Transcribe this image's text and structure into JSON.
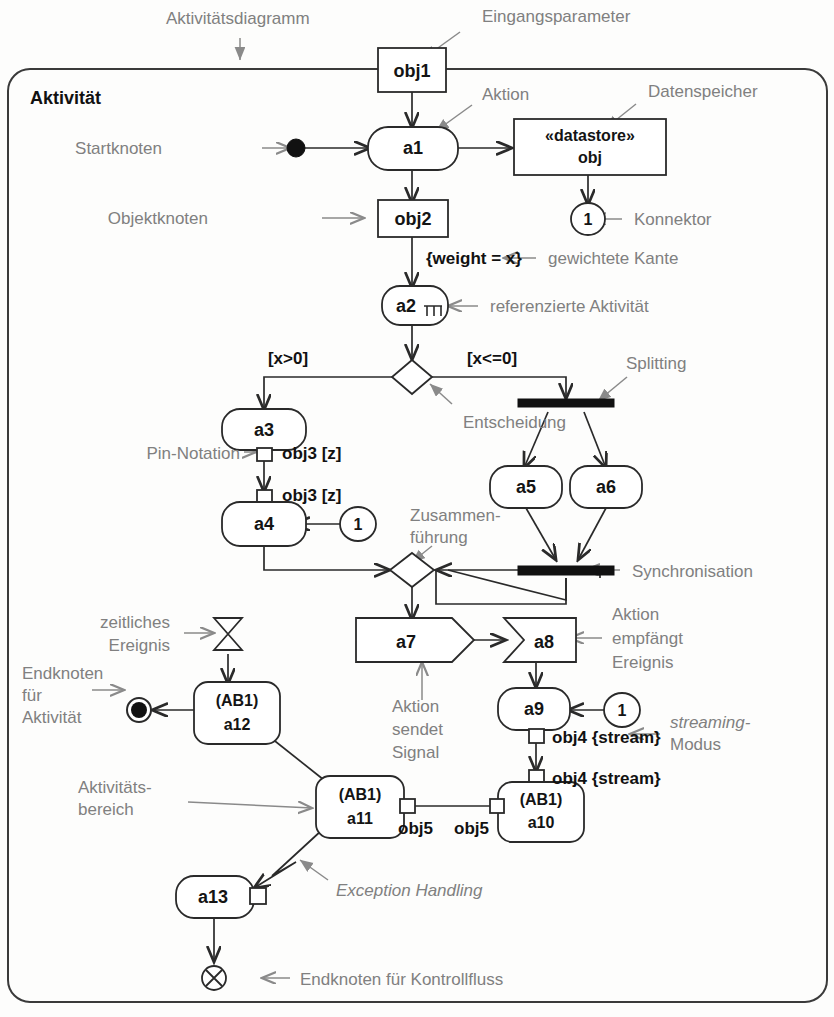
{
  "diagram": {
    "title": "Aktivitätsdiagramm",
    "frame_label": "Aktivität",
    "notation": "UML Aktivitätsdiagramm"
  },
  "annotations": [
    {
      "id": "aktivitaetsdiagramm",
      "text": "Aktivitätsdiagramm"
    },
    {
      "id": "eingangsparameter",
      "text": "Eingangsparameter"
    },
    {
      "id": "aktion",
      "text": "Aktion"
    },
    {
      "id": "datenspeicher",
      "text": "Datenspeicher"
    },
    {
      "id": "startknoten",
      "text": "Startknoten"
    },
    {
      "id": "objektknoten",
      "text": "Objektknoten"
    },
    {
      "id": "konnektor",
      "text": "Konnektor"
    },
    {
      "id": "gewichtete-kante",
      "text": "gewichtete Kante"
    },
    {
      "id": "referenzierte-aktivitaet",
      "text": "referenzierte Aktivität"
    },
    {
      "id": "entscheidung",
      "text": "Entscheidung"
    },
    {
      "id": "splitting",
      "text": "Splitting"
    },
    {
      "id": "pin-notation",
      "text": "Pin-Notation"
    },
    {
      "id": "zusammenfuehrung-1",
      "text": "Zusammen-"
    },
    {
      "id": "zusammenfuehrung-2",
      "text": "führung"
    },
    {
      "id": "synchronisation",
      "text": "Synchronisation"
    },
    {
      "id": "zeitliches-1",
      "text": "zeitliches"
    },
    {
      "id": "zeitliches-2",
      "text": "Ereignis"
    },
    {
      "id": "aktion-empfaengt-1",
      "text": "Aktion"
    },
    {
      "id": "aktion-empfaengt-2",
      "text": "empfängt"
    },
    {
      "id": "aktion-empfaengt-3",
      "text": "Ereignis"
    },
    {
      "id": "aktion-sendet-1",
      "text": "Aktion"
    },
    {
      "id": "aktion-sendet-2",
      "text": "sendet"
    },
    {
      "id": "aktion-sendet-3",
      "text": "Signal"
    },
    {
      "id": "endknoten-akt-1",
      "text": "Endknoten"
    },
    {
      "id": "endknoten-akt-2",
      "text": "für"
    },
    {
      "id": "endknoten-akt-3",
      "text": "Aktivität"
    },
    {
      "id": "streaming-1",
      "text": "streaming-"
    },
    {
      "id": "streaming-2",
      "text": "Modus"
    },
    {
      "id": "aktivitaetsbereich-1",
      "text": "Aktivitäts-"
    },
    {
      "id": "aktivitaetsbereich-2",
      "text": "bereich"
    },
    {
      "id": "exception-handling",
      "text": "Exception Handling"
    },
    {
      "id": "endknoten-kontrollfluss",
      "text": "Endknoten für Kontrollfluss"
    }
  ],
  "nodes": {
    "obj1": "obj1",
    "a1": "a1",
    "datastore_stereotype": "«datastore»",
    "datastore_name": "obj",
    "connector_1": "1",
    "obj2": "obj2",
    "weight_edge": "{weight = x}",
    "a2": "a2",
    "guard_left": "[x>0]",
    "guard_right": "[x<=0]",
    "a3": "a3",
    "a4": "a4",
    "connector_a4": "1",
    "pin_label_out": "obj3 [z]",
    "pin_label_in": "obj3 [z]",
    "a5": "a5",
    "a6": "a6",
    "a7": "a7",
    "a8": "a8",
    "a9": "a9",
    "connector_a9": "1",
    "pin_obj4_out": "obj4 {stream}",
    "pin_obj4_in": "obj4 {stream}",
    "a10_region": "(AB1)",
    "a10": "a10",
    "a11_region": "(AB1)",
    "a11": "a11",
    "a12_region": "(AB1)",
    "a12": "a12",
    "a13": "a13",
    "pin_obj5_left": "obj5",
    "pin_obj5_right": "obj5"
  },
  "colors": {
    "annotation": "#808080",
    "node_stroke": "#2a2a2a",
    "node_text": "#141414",
    "fill": "#ffffff",
    "bar": "#111111",
    "page": "#fdfdfc"
  }
}
